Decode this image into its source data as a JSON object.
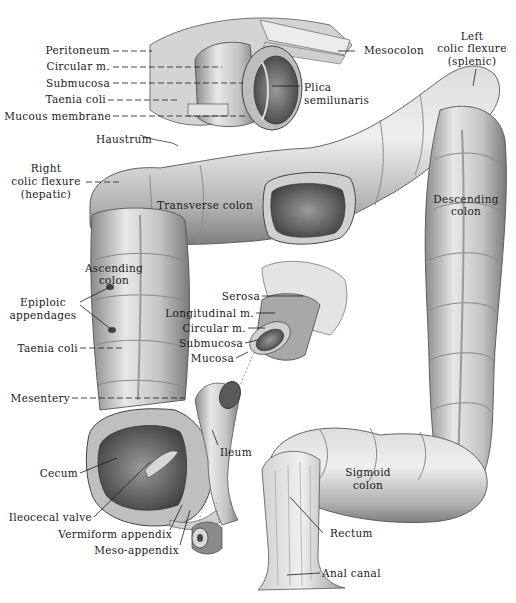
{
  "figure": {
    "colors": {
      "ink": "#1a1a1a",
      "tissue_light": "#e6e6e6",
      "tissue_mid": "#b8b8b8",
      "tissue_dark": "#6e6e6e",
      "lumen": "#555555",
      "background": "#ffffff"
    }
  },
  "labels": {
    "peritoneum": "Peritoneum",
    "circular_m_top": "Circular m.",
    "submucosa_top": "Submucosa",
    "taenia_coli_top": "Taenia coli",
    "mucous_membrane": "Mucous membrane",
    "haustrum": "Haustrum",
    "mesocolon": "Mesocolon",
    "plica_1": "Plica",
    "plica_2": "semilunaris",
    "left_flexure_1": "Left",
    "left_flexure_2": "colic flexure",
    "left_flexure_3": "(splenic)",
    "right_flexure_1": "Right",
    "right_flexure_2": "colic flexure",
    "right_flexure_3": "(hepatic)",
    "transverse_colon": "Transverse colon",
    "descending_1": "Descending",
    "descending_2": "colon",
    "ascending_1": "Ascending",
    "ascending_2": "colon",
    "epiploic_1": "Epiploic",
    "epiploic_2": "appendages",
    "taenia_coli_mid": "Taenia coli",
    "serosa": "Serosa",
    "longitudinal_m": "Longitudinal m.",
    "circular_m_mid": "Circular m.",
    "submucosa_mid": "Submucosa",
    "mucosa": "Mucosa",
    "mesentery": "Mesentery",
    "ileum": "Ileum",
    "cecum": "Cecum",
    "ileocecal_valve": "Ileocecal valve",
    "vermiform_appendix": "Vermiform appendix",
    "meso_appendix": "Meso-appendix",
    "sigmoid_1": "Sigmoid",
    "sigmoid_2": "colon",
    "rectum": "Rectum",
    "anal_canal": "Anal canal"
  }
}
